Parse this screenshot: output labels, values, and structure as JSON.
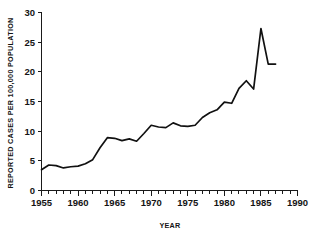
{
  "chart_data": {
    "type": "line",
    "title": "",
    "xlabel": "YEAR",
    "ylabel": "REPORTED CASES PER 100,000 POPULATION",
    "xlim": [
      1955,
      1990
    ],
    "ylim": [
      0,
      30
    ],
    "grid": false,
    "legend": null,
    "x_ticks_major": [
      1955,
      1960,
      1965,
      1970,
      1975,
      1980,
      1985,
      1990
    ],
    "x_tick_labels": [
      "1955",
      "1960",
      "1965",
      "1970",
      "1975",
      "1980",
      "1985",
      "1990"
    ],
    "x_minor_tick_interval": 1,
    "y_ticks_major": [
      0,
      5,
      10,
      15,
      20,
      25,
      30
    ],
    "y_tick_labels": [
      "0",
      "5",
      "10",
      "15",
      "20",
      "25",
      "30"
    ],
    "line_color": "#111111",
    "series": [
      {
        "name": "Reported cases per 100,000 population",
        "x": [
          1955,
          1956,
          1957,
          1958,
          1959,
          1960,
          1961,
          1962,
          1963,
          1964,
          1965,
          1966,
          1967,
          1968,
          1969,
          1970,
          1971,
          1972,
          1973,
          1974,
          1975,
          1976,
          1977,
          1978,
          1979,
          1980,
          1981,
          1982,
          1983,
          1984,
          1985,
          1986,
          1987
        ],
        "values": [
          3.5,
          4.3,
          4.2,
          3.8,
          4.0,
          4.1,
          4.5,
          5.2,
          7.2,
          8.9,
          8.8,
          8.4,
          8.7,
          8.3,
          9.6,
          11.0,
          10.7,
          10.6,
          11.4,
          10.9,
          10.8,
          11.0,
          12.3,
          13.1,
          13.6,
          14.9,
          14.7,
          17.2,
          18.5,
          17.1,
          27.3,
          21.3,
          21.3
        ]
      }
    ]
  },
  "axis_labels": {
    "x_title": "YEAR",
    "y_title": "REPORTED CASES PER 100,000 POPULATION"
  }
}
